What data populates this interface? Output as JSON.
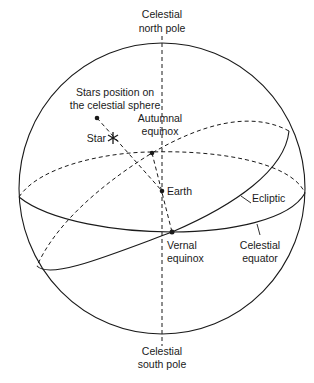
{
  "diagram": {
    "title": "Celestial sphere",
    "labels": {
      "north_pole_line1": "Celestial",
      "north_pole_line2": "north pole",
      "south_pole_line1": "Celestial",
      "south_pole_line2": "south pole",
      "star_position_line1": "Stars position on",
      "star_position_line2": "the celestial sphere",
      "star": "Star",
      "autumnal_line1": "Autumnal",
      "autumnal_line2": "equinox",
      "earth": "Earth",
      "ecliptic": "Ecliptic",
      "vernal_line1": "Vernal",
      "vernal_line2": "equinox",
      "equator_line1": "Celestial",
      "equator_line2": "equator"
    },
    "points": {
      "star_position": [
        97,
        118
      ],
      "star": [
        113,
        138
      ],
      "autumnal_equinox": [
        152,
        153
      ],
      "earth": [
        162,
        191
      ],
      "vernal_equinox": [
        172,
        232
      ]
    },
    "colors": {
      "line": "#1a1a1a",
      "background": "#ffffff"
    }
  }
}
